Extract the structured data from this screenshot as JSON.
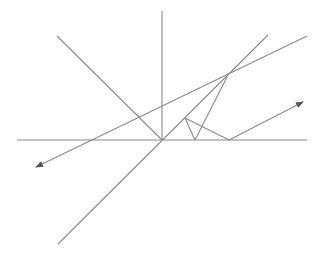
{
  "diagram": {
    "title": "",
    "width": 319,
    "height": 257,
    "stroke_color": "#8a8a8a",
    "background": "#ffffff",
    "points": {
      "origin": [
        162,
        140
      ],
      "intersection": [
        227,
        77
      ],
      "small_peak": [
        185,
        118
      ],
      "foot": [
        195,
        140
      ],
      "bounce": [
        229,
        140
      ]
    },
    "lines": [
      {
        "name": "horizontal-axis",
        "from": [
          17,
          140
        ],
        "to": [
          307,
          140
        ],
        "arrow": false
      },
      {
        "name": "vertical-axis",
        "from": [
          162,
          11
        ],
        "to": [
          162,
          140
        ],
        "arrow": false
      },
      {
        "name": "incident-diagonal",
        "from": [
          57,
          36
        ],
        "to": [
          162,
          140
        ],
        "arrow": false
      },
      {
        "name": "steep-through-line",
        "from": [
          58,
          244
        ],
        "to": [
          268,
          35
        ],
        "arrow": false
      },
      {
        "name": "shallow-ray",
        "from": [
          307,
          36
        ],
        "to": [
          36,
          167
        ],
        "arrow": true
      },
      {
        "name": "intersection-to-foot",
        "from": [
          227,
          77
        ],
        "to": [
          195,
          140
        ],
        "arrow": false
      },
      {
        "name": "peak-to-foot",
        "from": [
          185,
          118
        ],
        "to": [
          195,
          140
        ],
        "arrow": false
      },
      {
        "name": "peak-to-bounce",
        "from": [
          185,
          118
        ],
        "to": [
          229,
          140
        ],
        "arrow": false
      },
      {
        "name": "reflected-ray",
        "from": [
          229,
          140
        ],
        "to": [
          303,
          102
        ],
        "arrow": true
      }
    ]
  }
}
